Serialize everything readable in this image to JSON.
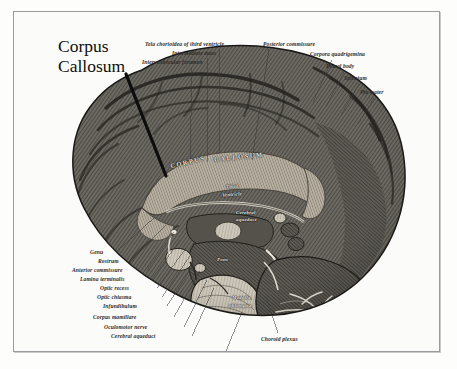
{
  "figure": {
    "title": "Corpus Callosum",
    "callout_label": "Corpus\nCallosum",
    "style": "monochrome anatomical engraving",
    "frame_color": "#9b9b9f",
    "background_color": "#fbfbfa",
    "ink_color": "#2c2c2c"
  },
  "labels_top": [
    {
      "text": "Tela chorioidea of third ventricle",
      "x": 131,
      "y": 30,
      "align": "left",
      "leader": {
        "x1": 205,
        "y1": 37,
        "x2": 205,
        "y2": 141
      }
    },
    {
      "text": "Intermediate mass",
      "x": 158,
      "y": 39,
      "align": "left",
      "leader": {
        "x1": 193,
        "y1": 46,
        "x2": 193,
        "y2": 150
      }
    },
    {
      "text": "Interventricular foramen",
      "x": 128,
      "y": 48,
      "align": "left",
      "leader": {
        "x1": 178,
        "y1": 55,
        "x2": 176,
        "y2": 152
      }
    },
    {
      "text": "Posterior commissure",
      "x": 249,
      "y": 30,
      "align": "left",
      "leader": {
        "x1": 255,
        "y1": 37,
        "x2": 238,
        "y2": 148
      }
    }
  ],
  "labels_right": [
    {
      "text": "Corpora quadrigemina",
      "x": 296,
      "y": 40,
      "leader": {
        "x1": 318,
        "y1": 48,
        "x2": 299,
        "y2": 90
      }
    },
    {
      "text": "Pineal body",
      "x": 312,
      "y": 52,
      "leader": {
        "x1": 330,
        "y1": 60,
        "x2": 312,
        "y2": 95
      }
    },
    {
      "text": "Splenium",
      "x": 330,
      "y": 64,
      "leader": {
        "x1": 345,
        "y1": 72,
        "x2": 327,
        "y2": 103
      }
    },
    {
      "text": "Pia mater",
      "x": 346,
      "y": 78,
      "leader": {
        "x1": 360,
        "y1": 86,
        "x2": 344,
        "y2": 112
      }
    }
  ],
  "labels_left": [
    {
      "text": "Genu",
      "x": 76,
      "y": 238,
      "leader": {
        "x1": 102,
        "y1": 240,
        "x2": 141,
        "y2": 205
      }
    },
    {
      "text": "Rostrum",
      "x": 84,
      "y": 247,
      "leader": {
        "x1": 117,
        "y1": 249,
        "x2": 152,
        "y2": 213
      }
    },
    {
      "text": "Anterior commissure",
      "x": 58,
      "y": 256,
      "leader": {
        "x1": 133,
        "y1": 258,
        "x2": 160,
        "y2": 220
      }
    },
    {
      "text": "Lamina terminalis",
      "x": 66,
      "y": 265,
      "leader": {
        "x1": 138,
        "y1": 267,
        "x2": 166,
        "y2": 228
      }
    },
    {
      "text": "Optic recess",
      "x": 86,
      "y": 274,
      "leader": {
        "x1": 143,
        "y1": 276,
        "x2": 172,
        "y2": 236
      }
    },
    {
      "text": "Optic chiasma",
      "x": 83,
      "y": 283,
      "leader": {
        "x1": 148,
        "y1": 285,
        "x2": 176,
        "y2": 244
      }
    },
    {
      "text": "Infundibulum",
      "x": 89,
      "y": 292,
      "leader": {
        "x1": 153,
        "y1": 294,
        "x2": 180,
        "y2": 252
      }
    },
    {
      "text": "Corpus mamillare",
      "x": 79,
      "y": 303,
      "leader": {
        "x1": 160,
        "y1": 305,
        "x2": 186,
        "y2": 259
      }
    },
    {
      "text": "Oculomotor nerve",
      "x": 90,
      "y": 313,
      "leader": {
        "x1": 170,
        "y1": 315,
        "x2": 193,
        "y2": 268
      }
    },
    {
      "text": "Cerebral aqueduct",
      "x": 97,
      "y": 322,
      "leader": {
        "x1": 178,
        "y1": 324,
        "x2": 200,
        "y2": 276
      }
    }
  ],
  "labels_bottom": [
    {
      "text": "Fourth ventricle",
      "x": 173,
      "y": 343,
      "leader": {
        "x1": 212,
        "y1": 339,
        "x2": 228,
        "y2": 300
      }
    },
    {
      "text": "Choroid plexus",
      "x": 247,
      "y": 325,
      "leader": {
        "x1": 264,
        "y1": 321,
        "x2": 252,
        "y2": 285
      }
    }
  ],
  "interior_labels": [
    {
      "text": "CORPUS",
      "x": 156,
      "y": 147,
      "size": "caps",
      "rotate": -14
    },
    {
      "text": "CALLOSUM",
      "x": 200,
      "y": 142,
      "size": "caps",
      "rotate": -6
    },
    {
      "text": "Third",
      "x": 212,
      "y": 172,
      "size": "sm",
      "rotate": -4
    },
    {
      "text": "Ventricle",
      "x": 208,
      "y": 180,
      "size": "sm",
      "rotate": -4
    },
    {
      "text": "Cerebral",
      "x": 222,
      "y": 198,
      "size": "sm",
      "rotate": 0
    },
    {
      "text": "aqueduct",
      "x": 222,
      "y": 205,
      "size": "sm",
      "rotate": 0
    },
    {
      "text": "Pons",
      "x": 203,
      "y": 245,
      "size": "sm",
      "rotate": 0
    },
    {
      "text": "Medulla",
      "x": 218,
      "y": 283,
      "size": "sm",
      "rotate": 0
    },
    {
      "text": "oblongata",
      "x": 215,
      "y": 291,
      "size": "sm",
      "rotate": 0
    }
  ],
  "callout_pointer": {
    "x1": 112,
    "y1": 62,
    "x2": 152,
    "y2": 164,
    "width": 3.2,
    "color": "#0d0d0d"
  }
}
